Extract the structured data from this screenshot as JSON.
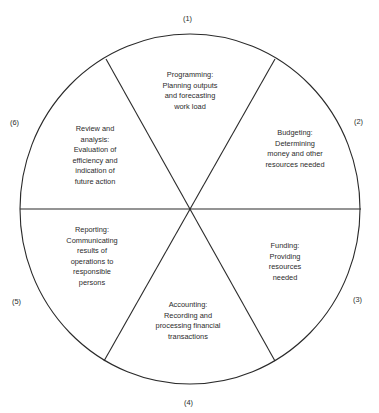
{
  "diagram": {
    "type": "cycle-wheel",
    "segments": [
      {
        "number": "(1)",
        "lines": [
          "Programming:",
          "Planning outputs",
          "and forecasting",
          "work load"
        ]
      },
      {
        "number": "(2)",
        "lines": [
          "Budgeting:",
          "Determining",
          "money and other",
          "resources needed"
        ]
      },
      {
        "number": "(3)",
        "lines": [
          "Funding:",
          "Providing",
          "resources",
          "needed"
        ]
      },
      {
        "number": "(4)",
        "lines": [
          "Accounting:",
          "Recording and",
          "processing financial",
          "transactions"
        ]
      },
      {
        "number": "(5)",
        "lines": [
          "Reporting:",
          "Communicating",
          "results of",
          "operations to",
          "responsible",
          "persons"
        ]
      },
      {
        "number": "(6)",
        "lines": [
          "Review and",
          "analysis:",
          "Evaluation of",
          "efficiency and",
          "indication of",
          "future action"
        ]
      }
    ],
    "colors": {
      "line": "#2a2a2a",
      "background": "#ffffff"
    }
  }
}
